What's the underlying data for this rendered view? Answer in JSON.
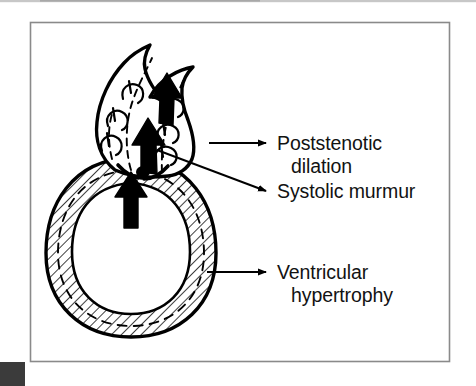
{
  "figure": {
    "kind": "medical line drawing",
    "background_color": "#ffffff",
    "border_color": "#8a8a8a",
    "ink_color": "#000000",
    "scan_artifact_color": "#3b3b3b",
    "top_scanline_color": "#b4b4b4"
  },
  "labels": [
    {
      "id": "poststenotic-dilation",
      "line1": "Poststenotic",
      "line2": "dilation"
    },
    {
      "id": "systolic-murmur",
      "line1": "Systolic murmur",
      "line2": ""
    },
    {
      "id": "ventricular-hypertrophy",
      "line1": "Ventricular",
      "line2": "hypertrophy"
    }
  ],
  "anatomy": {
    "aortic_root": "dilated aortic root (poststenotic dilation)",
    "ventricle": "hypertrophied left ventricle with hatched thick wall",
    "valve": "stenotic aortic valve",
    "flow_arrows": 3,
    "turbulence_swirls": 6
  }
}
